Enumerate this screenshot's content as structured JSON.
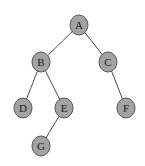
{
  "diagram": {
    "type": "binary-tree",
    "node_color": "#a3a3a3",
    "edge_color": "#4a4a4a",
    "nodes": [
      {
        "id": "A",
        "label": "A",
        "x": 79,
        "y": 25
      },
      {
        "id": "B",
        "label": "B",
        "x": 41,
        "y": 62
      },
      {
        "id": "C",
        "label": "C",
        "x": 108,
        "y": 62
      },
      {
        "id": "D",
        "label": "D",
        "x": 23,
        "y": 108
      },
      {
        "id": "E",
        "label": "E",
        "x": 64,
        "y": 108
      },
      {
        "id": "F",
        "label": "F",
        "x": 126,
        "y": 108
      },
      {
        "id": "G",
        "label": "G",
        "x": 41,
        "y": 146
      }
    ],
    "edges": [
      {
        "from": "A",
        "to": "B"
      },
      {
        "from": "A",
        "to": "C"
      },
      {
        "from": "B",
        "to": "D"
      },
      {
        "from": "B",
        "to": "E"
      },
      {
        "from": "C",
        "to": "F"
      },
      {
        "from": "E",
        "to": "G"
      }
    ]
  }
}
